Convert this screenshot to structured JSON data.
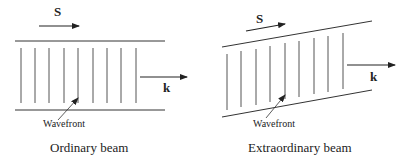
{
  "ordinary": {
    "poynting_label": "S",
    "wavevector_label": "k",
    "wavefront_label": "Wavefront",
    "caption": "Ordinary beam"
  },
  "extraordinary": {
    "poynting_label": "S",
    "wavevector_label": "k",
    "wavefront_label": "Wavefront",
    "caption": "Extraordinary beam"
  },
  "colors": {
    "line": "#333333",
    "wavefront": "#555555"
  }
}
